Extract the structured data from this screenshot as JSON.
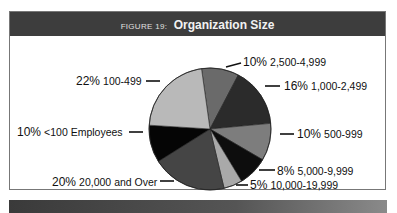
{
  "figure": {
    "prefix": "FIGURE 19:",
    "title": "Organization Size"
  },
  "chart_data": {
    "type": "pie",
    "title": "Organization Size",
    "figure_label": "FIGURE 19",
    "unit": "%",
    "slices": [
      {
        "label": "2,500-4,999",
        "value": 10,
        "color": "#6a6a6a"
      },
      {
        "label": "1,000-2,499",
        "value": 16,
        "color": "#2b2b2b"
      },
      {
        "label": "500-999",
        "value": 10,
        "color": "#7d7d7d"
      },
      {
        "label": "5,000-9,999",
        "value": 8,
        "color": "#0d0d0d"
      },
      {
        "label": "10,000-19,999",
        "value": 5,
        "color": "#a9a9a9"
      },
      {
        "label": "20,000 and Over",
        "value": 20,
        "color": "#454545"
      },
      {
        "label": "<100 Employees",
        "value": 10,
        "color": "#050505"
      },
      {
        "label": "100-499",
        "value": 22,
        "color": "#b9b9b9"
      }
    ],
    "start_angle_deg": -8,
    "direction": "clockwise",
    "legend": "callout labels"
  },
  "labels": {
    "s0": {
      "pct": "10%",
      "range": "2,500-4,999"
    },
    "s1": {
      "pct": "16%",
      "range": "1,000-2,499"
    },
    "s2": {
      "pct": "10%",
      "range": "500-999"
    },
    "s3": {
      "pct": "8%",
      "range": "5,000-9,999"
    },
    "s4": {
      "pct": "5%",
      "range": "10,000-19,999"
    },
    "s5": {
      "pct": "20%",
      "range": "20,000 and Over"
    },
    "s6": {
      "pct": "10%",
      "range": "<100 Employees"
    },
    "s7": {
      "pct": "22%",
      "range": "100-499"
    }
  }
}
